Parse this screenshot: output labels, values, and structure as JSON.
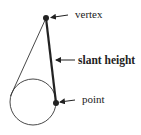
{
  "diagram": {
    "type": "cone-slant-height",
    "labels": {
      "vertex": "vertex",
      "slant_height": "slant height",
      "point": "point"
    },
    "colors": {
      "stroke": "#222222",
      "background": "#ffffff"
    }
  }
}
